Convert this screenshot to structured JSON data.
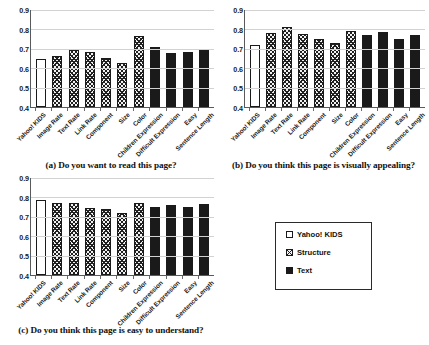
{
  "figure": {
    "legend": {
      "title": "",
      "entries": [
        {
          "label": "Yahoo! KIDS",
          "series": "yahoo"
        },
        {
          "label": "Structure",
          "series": "structure"
        },
        {
          "label": "Text",
          "series": "text"
        }
      ]
    }
  },
  "chart_data": [
    {
      "type": "bar",
      "panel": "a",
      "title": "(a) Do you want to read this page?",
      "xlabel": "",
      "ylabel": "",
      "ylim": [
        0.4,
        0.9
      ],
      "yticks": [
        0.4,
        0.5,
        0.6,
        0.7,
        0.8,
        0.9
      ],
      "ytick_labels": [
        "0.4",
        "0.5",
        "0.6",
        "0.7",
        "0.8",
        "0.9"
      ],
      "grid": true,
      "legend_position": "external-bottom-right",
      "categories": [
        "Yahoo! KIDS",
        "Image Rate",
        "Text Rate",
        "Link Rate",
        "Component",
        "Size",
        "Color",
        "Children Expression",
        "Difficult Expression",
        "Easy",
        "Sentence Length"
      ],
      "groups": [
        "yahoo",
        "structure",
        "structure",
        "structure",
        "structure",
        "structure",
        "structure",
        "text",
        "text",
        "text",
        "text"
      ],
      "values": [
        0.645,
        0.662,
        0.695,
        0.682,
        0.654,
        0.628,
        0.764,
        0.711,
        0.678,
        0.683,
        0.693
      ]
    },
    {
      "type": "bar",
      "panel": "b",
      "title": "(b) Do you think this page is visually appealing?",
      "xlabel": "",
      "ylabel": "",
      "ylim": [
        0.4,
        0.9
      ],
      "yticks": [
        0.4,
        0.5,
        0.6,
        0.7,
        0.8,
        0.9
      ],
      "ytick_labels": [
        "0.4",
        "0.5",
        "0.6",
        "0.7",
        "0.8",
        "0.9"
      ],
      "grid": true,
      "legend_position": "external-bottom-right",
      "categories": [
        "Yahoo! KIDS",
        "Image Rate",
        "Text Rate",
        "Link Rate",
        "Component",
        "Size",
        "Color",
        "Children Expression",
        "Difficult Expression",
        "Easy",
        "Sentence Length"
      ],
      "groups": [
        "yahoo",
        "structure",
        "structure",
        "structure",
        "structure",
        "structure",
        "structure",
        "text",
        "text",
        "text",
        "text"
      ],
      "values": [
        0.718,
        0.779,
        0.814,
        0.777,
        0.753,
        0.731,
        0.793,
        0.773,
        0.786,
        0.753,
        0.77
      ]
    },
    {
      "type": "bar",
      "panel": "c",
      "title": "(c) Do you think this page is easy to understand?",
      "xlabel": "",
      "ylabel": "",
      "ylim": [
        0.4,
        0.9
      ],
      "yticks": [
        0.4,
        0.5,
        0.6,
        0.7,
        0.8,
        0.9
      ],
      "ytick_labels": [
        "0.4",
        "0.5",
        "0.6",
        "0.7",
        "0.8",
        "0.9"
      ],
      "grid": true,
      "legend_position": "external-bottom-right",
      "categories": [
        "Yahoo! KIDS",
        "Image Rate",
        "Text Rate",
        "Link Rate",
        "Component",
        "Size",
        "Color",
        "Children Expression",
        "Difficult Expression",
        "Easy",
        "Sentence Length"
      ],
      "groups": [
        "yahoo",
        "structure",
        "structure",
        "structure",
        "structure",
        "structure",
        "structure",
        "text",
        "text",
        "text",
        "text"
      ],
      "values": [
        0.786,
        0.77,
        0.77,
        0.748,
        0.739,
        0.718,
        0.773,
        0.75,
        0.761,
        0.75,
        0.768
      ]
    }
  ]
}
